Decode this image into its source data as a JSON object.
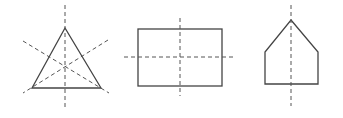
{
  "figure": {
    "colors": {
      "shape_stroke": "#444444",
      "axis_stroke": "#555555",
      "background": "#ffffff"
    },
    "shapes": [
      {
        "name": "equilateral-triangle",
        "lines_of_symmetry": 3
      },
      {
        "name": "rectangle",
        "lines_of_symmetry": 2
      },
      {
        "name": "pentagon-house",
        "lines_of_symmetry": 1
      }
    ]
  }
}
